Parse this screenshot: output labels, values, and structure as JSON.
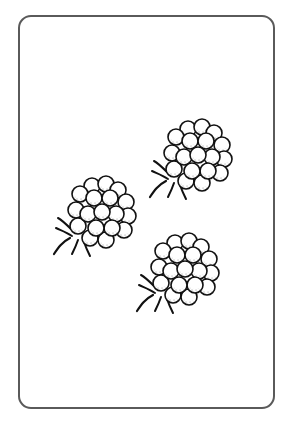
{
  "card": {
    "label": "Three raspberries",
    "border_color": "#5a5a5a",
    "background": "#ffffff",
    "count": 3
  },
  "items": [
    {
      "name": "raspberry-top-right",
      "x": 152,
      "y": 118
    },
    {
      "name": "raspberry-middle-left",
      "x": 52,
      "y": 176
    },
    {
      "name": "raspberry-bottom-right",
      "x": 135,
      "y": 232
    }
  ]
}
